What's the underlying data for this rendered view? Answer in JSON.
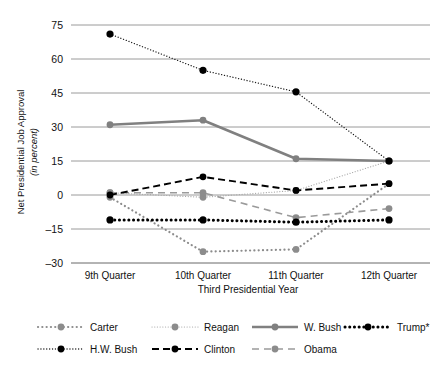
{
  "chart_data": {
    "type": "line",
    "title": "",
    "xlabel": "Third Presidential Year",
    "ylabel": "Net Presidential Job Approval",
    "ylabel_sub": "(in percent)",
    "categories": [
      "9th Quarter",
      "10th Quarter",
      "11th Quarter",
      "12th Quarter"
    ],
    "yticks": [
      "75",
      "60",
      "45",
      "30",
      "15",
      "0",
      "–15",
      "–30"
    ],
    "ytick_values": [
      75,
      60,
      45,
      30,
      15,
      0,
      -15,
      -30
    ],
    "ylim": [
      -30,
      75
    ],
    "grid": true,
    "legend_position": "bottom",
    "series": [
      {
        "name": "Carter",
        "values": [
          -1,
          -25,
          -24,
          5
        ],
        "style": "dotted-thick",
        "color": "#8c8c8c",
        "marker": "#8c8c8c"
      },
      {
        "name": "Reagan",
        "values": [
          1,
          -1,
          2,
          15
        ],
        "style": "dotted-fine",
        "color": "#a8a8a8",
        "marker": "#8c8c8c"
      },
      {
        "name": "W. Bush",
        "values": [
          31,
          33,
          16,
          15
        ],
        "style": "solid",
        "color": "#808080",
        "marker": "#808080"
      },
      {
        "name": "Trump*",
        "values": [
          -11,
          -11,
          -12,
          -11
        ],
        "style": "dotted-bold",
        "color": "#000000",
        "marker": "#000000"
      },
      {
        "name": "H.W. Bush",
        "values": [
          71,
          55,
          45.5,
          15
        ],
        "style": "dotted-dark",
        "color": "#1a1a1a",
        "marker": "#000000"
      },
      {
        "name": "Clinton",
        "values": [
          0,
          8,
          2,
          5
        ],
        "style": "dashed",
        "color": "#000000",
        "marker": "#000000"
      },
      {
        "name": "Obama",
        "values": [
          1,
          1,
          -10,
          -6
        ],
        "style": "dashed-gray",
        "color": "#9a9a9a",
        "marker": "#8c8c8c"
      }
    ]
  },
  "legend": {
    "row1": [
      "Carter",
      "Reagan",
      "W. Bush",
      "Trump*"
    ],
    "row2": [
      "H.W. Bush",
      "Clinton",
      "Obama"
    ]
  }
}
